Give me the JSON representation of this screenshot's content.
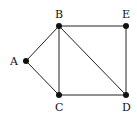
{
  "graph": {
    "nodes": [
      {
        "id": "A",
        "label": "A",
        "x": 26,
        "y": 61,
        "lx": 10,
        "ly": 65
      },
      {
        "id": "B",
        "label": "B",
        "x": 59,
        "y": 26,
        "lx": 55,
        "ly": 18
      },
      {
        "id": "E",
        "label": "E",
        "x": 126,
        "y": 26,
        "lx": 122,
        "ly": 18
      },
      {
        "id": "C",
        "label": "C",
        "x": 59,
        "y": 95,
        "lx": 55,
        "ly": 111
      },
      {
        "id": "D",
        "label": "D",
        "x": 126,
        "y": 95,
        "lx": 122,
        "ly": 111
      }
    ],
    "edges": [
      [
        "A",
        "B"
      ],
      [
        "A",
        "C"
      ],
      [
        "B",
        "C"
      ],
      [
        "B",
        "E"
      ],
      [
        "B",
        "D"
      ],
      [
        "C",
        "D"
      ],
      [
        "E",
        "D"
      ]
    ],
    "line_color": "#222222",
    "node_color": "#111111"
  }
}
